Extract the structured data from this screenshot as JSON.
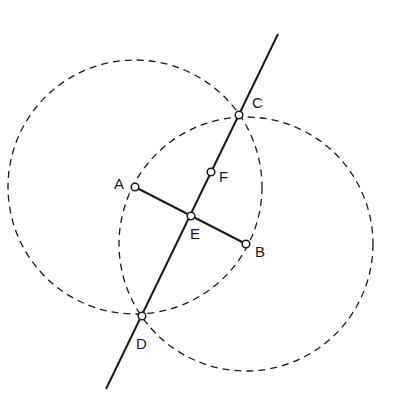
{
  "diagram": {
    "colors": {
      "stroke": "#1a1a1a",
      "background": "#ffffff",
      "point_fill": "#ffffff"
    },
    "points": {
      "A": {
        "label": "A",
        "x": 135,
        "y": 187
      },
      "B": {
        "label": "B",
        "x": 246,
        "y": 244
      },
      "C": {
        "label": "C",
        "x": 239,
        "y": 115
      },
      "D": {
        "label": "D",
        "x": 142,
        "y": 316
      },
      "E": {
        "label": "E",
        "x": 191,
        "y": 216
      },
      "F": {
        "label": "F",
        "x": 211,
        "y": 172
      }
    },
    "circles": [
      {
        "center": "A",
        "radius": 127,
        "style": "dashed"
      },
      {
        "center": "B",
        "radius": 127,
        "style": "dashed"
      }
    ],
    "segments": [
      {
        "from": "A",
        "to": "B",
        "style": "solid"
      }
    ],
    "lines": [
      {
        "through": [
          "C",
          "D"
        ],
        "x1": 278,
        "y1": 34,
        "x2": 106,
        "y2": 389,
        "style": "solid"
      }
    ]
  }
}
